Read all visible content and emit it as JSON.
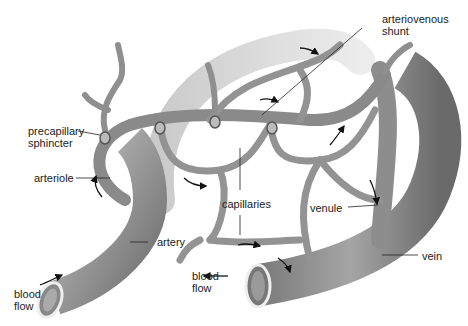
{
  "diagram": {
    "labels": {
      "arteriovenous_shunt_line1": "arteriovenous",
      "arteriovenous_shunt_line2": "shunt",
      "precapillary_sphincter_line1": "precapillary",
      "precapillary_sphincter_line2": "sphincter",
      "arteriole": "arteriole",
      "capillaries": "capillaries",
      "venule": "venule",
      "artery": "artery",
      "vein": "vein",
      "blood_flow_left_line1": "blood",
      "blood_flow_left_line2": "flow",
      "blood_flow_right_line1": "blood",
      "blood_flow_right_line2": "flow"
    },
    "colors": {
      "vessel_dark": "#6f6f6f",
      "vessel_mid": "#9a9a9a",
      "vessel_light": "#c8c8c8",
      "line": "#222222",
      "background": "#ffffff"
    }
  }
}
